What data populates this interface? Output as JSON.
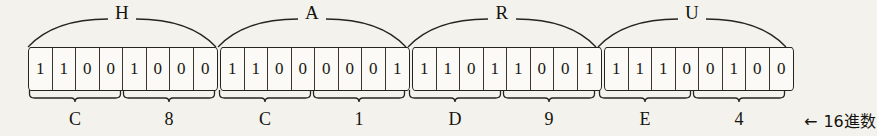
{
  "figure": {
    "annotation": "16進数",
    "annotation_arrow": "←",
    "geometry": {
      "grid_left": 28,
      "grid_right": 795,
      "cell_width": 23.5,
      "group_gap": 2
    },
    "colors": {
      "paper": "#f4f2ed",
      "cell_fill": "#fbfaf6",
      "ink": "#26241e",
      "text": "#15140f"
    }
  },
  "characters": [
    {
      "label": "H",
      "bits": [
        "1",
        "1",
        "0",
        "0",
        "1",
        "0",
        "0",
        "0"
      ],
      "nibbles": [
        {
          "hex": "C",
          "bits": [
            "1",
            "1",
            "0",
            "0"
          ]
        },
        {
          "hex": "8",
          "bits": [
            "1",
            "0",
            "0",
            "0"
          ]
        }
      ]
    },
    {
      "label": "A",
      "bits": [
        "1",
        "1",
        "0",
        "0",
        "0",
        "0",
        "0",
        "1"
      ],
      "nibbles": [
        {
          "hex": "C",
          "bits": [
            "1",
            "1",
            "0",
            "0"
          ]
        },
        {
          "hex": "1",
          "bits": [
            "0",
            "0",
            "0",
            "1"
          ]
        }
      ]
    },
    {
      "label": "R",
      "bits": [
        "1",
        "1",
        "0",
        "1",
        "1",
        "0",
        "0",
        "1"
      ],
      "nibbles": [
        {
          "hex": "D",
          "bits": [
            "1",
            "1",
            "0",
            "1"
          ]
        },
        {
          "hex": "9",
          "bits": [
            "1",
            "0",
            "0",
            "1"
          ]
        }
      ]
    },
    {
      "label": "U",
      "bits": [
        "1",
        "1",
        "1",
        "0",
        "0",
        "1",
        "0",
        "0"
      ],
      "nibbles": [
        {
          "hex": "E",
          "bits": [
            "1",
            "1",
            "1",
            "0"
          ]
        },
        {
          "hex": "4",
          "bits": [
            "0",
            "1",
            "0",
            "0"
          ]
        }
      ]
    }
  ]
}
